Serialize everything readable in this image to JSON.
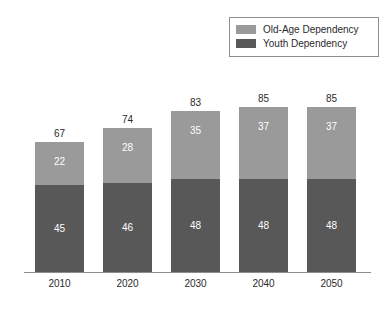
{
  "chart_data": {
    "type": "bar",
    "stacked": true,
    "title": "",
    "subtitle": "",
    "xlabel": "",
    "ylabel": "",
    "ylim": [
      0,
      100
    ],
    "grid": false,
    "legend_position": "top-right",
    "categories": [
      "2010",
      "2020",
      "2030",
      "2040",
      "2050"
    ],
    "series": [
      {
        "name": "Old-Age Dependency",
        "color": "#9a9a9a",
        "values": [
          22,
          28,
          35,
          37,
          37
        ]
      },
      {
        "name": "Youth Dependency",
        "color": "#585858",
        "values": [
          45,
          46,
          48,
          48,
          48
        ]
      }
    ],
    "totals": [
      67,
      74,
      83,
      85,
      85
    ],
    "value_labels": {
      "old_age": [
        "22",
        "28",
        "35",
        "37",
        "37"
      ],
      "youth": [
        "45",
        "46",
        "48",
        "48",
        "48"
      ],
      "totals": [
        "67",
        "74",
        "83",
        "85",
        "85"
      ]
    }
  },
  "legend": {
    "items": [
      {
        "label": "Old-Age Dependency",
        "color": "#9a9a9a"
      },
      {
        "label": "Youth Dependency",
        "color": "#585858"
      }
    ]
  },
  "axis": {
    "ticks": [
      "2010",
      "2020",
      "2030",
      "2040",
      "2050"
    ]
  },
  "colors": {
    "old_age": "#9a9a9a",
    "youth": "#585858",
    "axis": "#8d8d8d",
    "text": "#2b2b2b",
    "value_text": "#ffffff",
    "background": "#ffffff",
    "legend_border": "#8d8d8d"
  }
}
